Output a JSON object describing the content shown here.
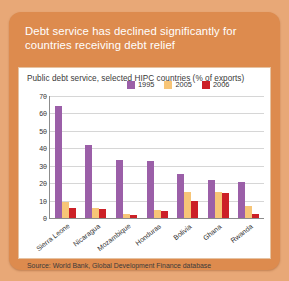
{
  "card": {
    "title": "Debt service has declined significantly for countries receiving debt relief",
    "subtitle": "Public debt service, selected HIPC countries (% of exports)",
    "source": "Source: World Bank, Global Development Finance database"
  },
  "colors": {
    "card_bg": "#dd8b4e",
    "page_bg": "#e8a877",
    "panel_bg": "#ffffff",
    "series_1995": "#9b5fa8",
    "series_2005": "#f7c577",
    "series_2006": "#cc2027"
  },
  "chart_data": {
    "type": "bar",
    "title": "Public debt service, selected HIPC countries (% of exports)",
    "xlabel": "",
    "ylabel": "",
    "ylim": [
      0,
      70
    ],
    "yticks": [
      0,
      10,
      20,
      30,
      40,
      50,
      60,
      70
    ],
    "grid": true,
    "legend_position": "top",
    "categories": [
      "Sierra Leone",
      "Nicaragua",
      "Mozambique",
      "Honduras",
      "Bolivia",
      "Ghana",
      "Rwanda"
    ],
    "series": [
      {
        "name": "1995",
        "color": "#9b5fa8",
        "values": [
          64,
          42,
          33.5,
          33,
          25.5,
          22,
          20.5
        ]
      },
      {
        "name": "2005",
        "color": "#f7c577",
        "values": [
          9,
          5.5,
          2.5,
          4.5,
          15,
          15,
          7
        ]
      },
      {
        "name": "2006",
        "color": "#cc2027",
        "values": [
          6,
          5,
          1.5,
          4,
          10,
          14.5,
          2.5
        ]
      }
    ]
  }
}
